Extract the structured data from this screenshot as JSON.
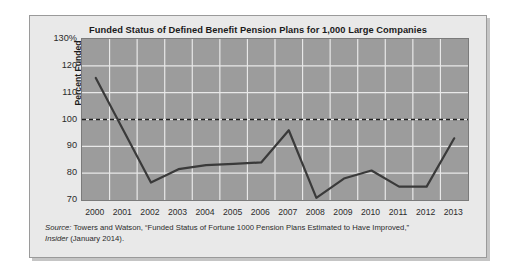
{
  "chart_data": {
    "type": "line",
    "title": "Funded Status of Defined Benefit Pension Plans for 1,000 Large Companies",
    "xlabel": "",
    "ylabel": "Percent Funded",
    "categories": [
      "2000",
      "2001",
      "2002",
      "2003",
      "2004",
      "2005",
      "2006",
      "2007",
      "2008",
      "2009",
      "2010",
      "2011",
      "2012",
      "2013"
    ],
    "values": [
      115.5,
      96.0,
      76.5,
      81.5,
      83.0,
      83.5,
      84.0,
      96.0,
      70.8,
      78.0,
      81.0,
      75.0,
      75.0,
      93.0
    ],
    "series": [
      {
        "name": "Percent Funded",
        "values": [
          115.5,
          96.0,
          76.5,
          81.5,
          83.0,
          83.5,
          84.0,
          96.0,
          70.8,
          78.0,
          81.0,
          75.0,
          75.0,
          93.0
        ]
      }
    ],
    "ylim": [
      70,
      130
    ],
    "yticks": [
      70,
      80,
      90,
      100,
      110,
      120,
      130
    ],
    "ytick_labels": [
      "70",
      "80",
      "90",
      "100",
      "110",
      "120",
      "130%"
    ],
    "reference_line": {
      "value": 100,
      "style": "dashed"
    },
    "grid": true,
    "legend": "none",
    "plot_background": "#9c9c9c",
    "line_color": "#3a3a3a",
    "gridline_color": "#e8e8e8"
  },
  "source": {
    "label": "Source:",
    "line1_text": " Towers and Watson, “Funded Status of Fortune 1000 Pension Plans Estimated to Have Improved,”",
    "publication": "Insider",
    "line2_text": " (January 2014)."
  }
}
